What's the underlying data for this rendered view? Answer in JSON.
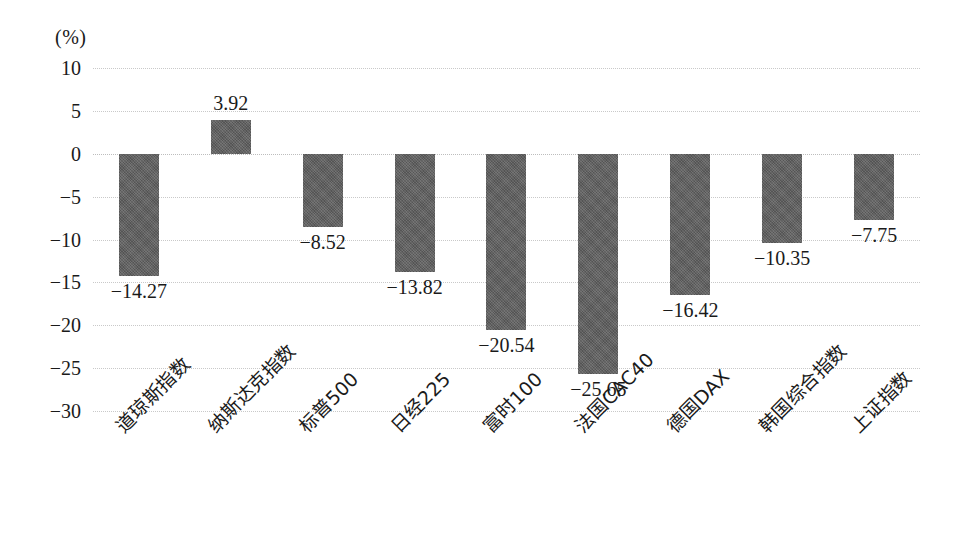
{
  "axis": {
    "unit_label": "(%)",
    "yticks": [
      "10",
      "5",
      "0",
      "−5",
      "−10",
      "−15",
      "−20",
      "−25",
      "−30"
    ]
  },
  "colors": {
    "bar": "#5f5f5f",
    "gridline": "#c9c9c9",
    "text": "#1a1a1a",
    "background": "#ffffff"
  },
  "chart_data": {
    "type": "bar",
    "title": "",
    "xlabel": "",
    "ylabel": "(%)",
    "ylim": [
      -30,
      10
    ],
    "ytick_step": 5,
    "grid": true,
    "legend": "none",
    "orientation": "vertical",
    "categories": [
      "道琼斯指数",
      "纳斯达克指数",
      "标普500",
      "日经225",
      "富时100",
      "法国CAC40",
      "德国DAX",
      "韩国综合指数",
      "上证指数"
    ],
    "values": [
      -14.27,
      3.92,
      -8.52,
      -13.82,
      -20.54,
      -25.65,
      -16.42,
      -10.35,
      -7.75
    ],
    "data_labels": [
      "−14.27",
      "3.92",
      "−8.52",
      "−13.82",
      "−20.54",
      "−25.65",
      "−16.42",
      "−10.35",
      "−7.75"
    ]
  }
}
